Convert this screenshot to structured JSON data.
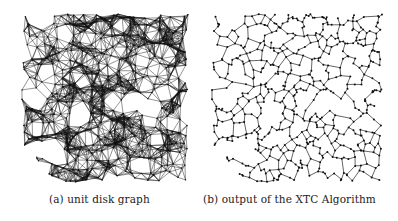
{
  "figure": {
    "panels": [
      {
        "id": "a",
        "caption": "(a) unit disk graph",
        "graph": {
          "type": "unit-disk-graph",
          "density": "dense",
          "edge_color": "#111111",
          "node_color": "#111111",
          "background": "#ffffff"
        }
      },
      {
        "id": "b",
        "caption": "(b) output of the XTC Algorithm",
        "graph": {
          "type": "xtc-topology",
          "density": "sparse",
          "edge_color": "#222222",
          "node_color": "#111111",
          "background": "#ffffff"
        }
      }
    ]
  }
}
